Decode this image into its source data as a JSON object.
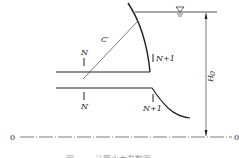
{
  "diagram": {
    "labels": {
      "curve_c": "C′",
      "section_n_upper": "N",
      "section_n_lower": "N",
      "section_n1_upper": "N+1",
      "section_n1_lower": "N+1",
      "head": "H",
      "head_sub": "0",
      "datum_left": "0",
      "datum_right": "0",
      "water_surface_symbol": "▽"
    },
    "caption": "图 …… 计算水力参数图"
  }
}
